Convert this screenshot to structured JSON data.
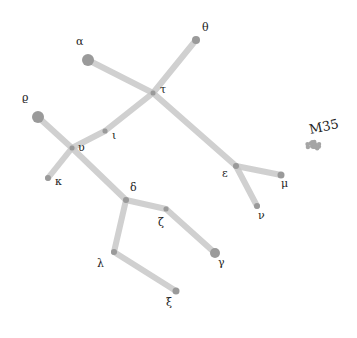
{
  "colors": {
    "background": "#ffffff",
    "line": "#c8c8c8",
    "star": "#9a9a9a",
    "label": "#222222"
  },
  "stars": [
    {
      "id": "alpha",
      "label": "α",
      "x": 88,
      "y": 60,
      "r": 6
    },
    {
      "id": "theta",
      "label": "θ",
      "x": 196,
      "y": 40,
      "r": 4
    },
    {
      "id": "tau",
      "label": "τ",
      "x": 153,
      "y": 93,
      "r": 2.5
    },
    {
      "id": "iota",
      "label": "ι",
      "x": 105,
      "y": 131,
      "r": 2.5
    },
    {
      "id": "upsilon",
      "label": "υ",
      "x": 72,
      "y": 148,
      "r": 2.5
    },
    {
      "id": "rho",
      "label": "ρ",
      "x": 38,
      "y": 117,
      "r": 6
    },
    {
      "id": "kappa",
      "label": "κ",
      "x": 48,
      "y": 178,
      "r": 3
    },
    {
      "id": "delta",
      "label": "δ",
      "x": 126,
      "y": 200,
      "r": 3
    },
    {
      "id": "zeta",
      "label": "ζ",
      "x": 166,
      "y": 209,
      "r": 2.5
    },
    {
      "id": "gamma",
      "label": "γ",
      "x": 215,
      "y": 253,
      "r": 5
    },
    {
      "id": "lambda",
      "label": "λ",
      "x": 114,
      "y": 252,
      "r": 3
    },
    {
      "id": "xi",
      "label": "ξ",
      "x": 176,
      "y": 291,
      "r": 3.5
    },
    {
      "id": "epsilon",
      "label": "ε",
      "x": 236,
      "y": 166,
      "r": 3
    },
    {
      "id": "mu",
      "label": "μ",
      "x": 281,
      "y": 175,
      "r": 3.5
    },
    {
      "id": "nu",
      "label": "ν",
      "x": 257,
      "y": 206,
      "r": 3
    }
  ],
  "edges": [
    [
      "alpha",
      "tau"
    ],
    [
      "theta",
      "tau"
    ],
    [
      "tau",
      "epsilon"
    ],
    [
      "tau",
      "iota"
    ],
    [
      "iota",
      "upsilon"
    ],
    [
      "rho",
      "upsilon"
    ],
    [
      "upsilon",
      "kappa"
    ],
    [
      "upsilon",
      "delta"
    ],
    [
      "delta",
      "zeta"
    ],
    [
      "zeta",
      "gamma"
    ],
    [
      "delta",
      "lambda"
    ],
    [
      "lambda",
      "xi"
    ],
    [
      "epsilon",
      "mu"
    ],
    [
      "epsilon",
      "nu"
    ]
  ],
  "labels": [
    {
      "text": "α",
      "x": 76,
      "y": 36
    },
    {
      "text": "θ",
      "x": 202,
      "y": 22
    },
    {
      "text": "τ",
      "x": 160,
      "y": 84
    },
    {
      "text": "ι",
      "x": 112,
      "y": 130
    },
    {
      "text": "υ",
      "x": 78,
      "y": 142
    },
    {
      "text": "ϱ",
      "x": 22,
      "y": 92
    },
    {
      "text": "κ",
      "x": 55,
      "y": 176
    },
    {
      "text": "δ",
      "x": 130,
      "y": 182
    },
    {
      "text": "ζ",
      "x": 158,
      "y": 217
    },
    {
      "text": "γ",
      "x": 218,
      "y": 257
    },
    {
      "text": "λ",
      "x": 97,
      "y": 258
    },
    {
      "text": "ξ",
      "x": 166,
      "y": 297
    },
    {
      "text": "ε",
      "x": 222,
      "y": 168
    },
    {
      "text": "μ",
      "x": 281,
      "y": 178
    },
    {
      "text": "ν",
      "x": 258,
      "y": 210
    }
  ],
  "cluster": {
    "label": "M35",
    "x": 314,
    "y": 145,
    "label_x": 309,
    "label_y": 120
  }
}
